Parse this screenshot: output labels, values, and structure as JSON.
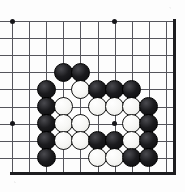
{
  "figure": {
    "board_style": "go-board",
    "colors": {
      "background": "#fdfdfd",
      "gridline": "#55555c",
      "edge": "#1d1d20",
      "black_stone": "#0f0f12",
      "white_stone": "#f7f7f5",
      "stone_outline": "#111111"
    },
    "geometry": {
      "origin_x": 12,
      "origin_y": 21,
      "spacing": 17.1,
      "columns": 10,
      "rows": 9,
      "stone_diameter": 19,
      "right_edge_x": 173,
      "bottom_edge_y": 172,
      "top_line_y": 21,
      "left_line_x": 12
    },
    "hoshi_points": [
      {
        "col": 0,
        "row": 0
      },
      {
        "col": 6,
        "row": 0
      },
      {
        "col": 0,
        "row": 6
      },
      {
        "col": 6,
        "row": 6
      }
    ],
    "stones": [
      {
        "col": 3,
        "row": 3,
        "color": "black"
      },
      {
        "col": 4,
        "row": 3,
        "color": "black"
      },
      {
        "col": 2,
        "row": 4,
        "color": "black"
      },
      {
        "col": 4,
        "row": 4,
        "color": "white"
      },
      {
        "col": 5,
        "row": 4,
        "color": "black"
      },
      {
        "col": 6,
        "row": 4,
        "color": "black"
      },
      {
        "col": 7,
        "row": 4,
        "color": "black"
      },
      {
        "col": 2,
        "row": 5,
        "color": "black"
      },
      {
        "col": 3,
        "row": 5,
        "color": "white"
      },
      {
        "col": 5,
        "row": 5,
        "color": "white"
      },
      {
        "col": 6,
        "row": 5,
        "color": "white"
      },
      {
        "col": 7,
        "row": 5,
        "color": "white"
      },
      {
        "col": 8,
        "row": 5,
        "color": "black"
      },
      {
        "col": 2,
        "row": 6,
        "color": "black"
      },
      {
        "col": 3,
        "row": 6,
        "color": "white"
      },
      {
        "col": 4,
        "row": 6,
        "color": "white"
      },
      {
        "col": 7,
        "row": 6,
        "color": "white"
      },
      {
        "col": 8,
        "row": 6,
        "color": "black"
      },
      {
        "col": 2,
        "row": 7,
        "color": "black"
      },
      {
        "col": 3,
        "row": 7,
        "color": "white"
      },
      {
        "col": 4,
        "row": 7,
        "color": "white"
      },
      {
        "col": 5,
        "row": 7,
        "color": "black"
      },
      {
        "col": 6,
        "row": 7,
        "color": "black"
      },
      {
        "col": 7,
        "row": 7,
        "color": "white"
      },
      {
        "col": 8,
        "row": 7,
        "color": "black"
      },
      {
        "col": 2,
        "row": 8,
        "color": "black"
      },
      {
        "col": 5,
        "row": 8,
        "color": "white"
      },
      {
        "col": 6,
        "row": 8,
        "color": "white"
      },
      {
        "col": 7,
        "row": 8,
        "color": "black"
      },
      {
        "col": 8,
        "row": 8,
        "color": "black"
      }
    ]
  }
}
